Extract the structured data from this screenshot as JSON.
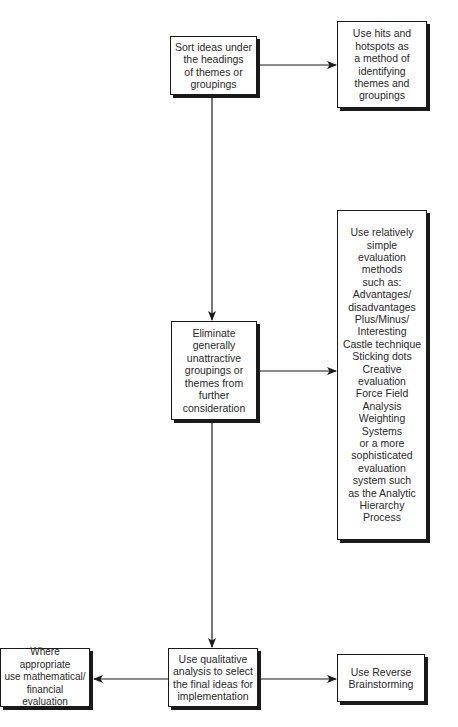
{
  "diagram": {
    "type": "flowchart",
    "nodes": {
      "sort": {
        "text": "Sort ideas under\nthe headings\nof themes or\ngroupings"
      },
      "hits": {
        "text": "Use hits and\nhotspots as\na method of\nidentifying\nthemes and\ngroupings"
      },
      "eliminate": {
        "text": "Eliminate\ngenerally\nunattractive\ngroupings or\nthemes from\nfurther\nconsideration"
      },
      "evaluation": {
        "text": "Use relatively\nsimple\nevaluation\nmethods\nsuch as:\nAdvantages/\ndisadvantages\nPlus/Minus/\nInteresting\nCastle technique\nSticking dots\nCreative\nevaluation\nForce Field\nAnalysis\nWeighting\nSystems\nor a more\nsophisticated\nevaluation\nsystem such\nas the Analytic\nHierarchy\nProcess"
      },
      "qualitative": {
        "text": "Use qualitative\nanalysis to select\nthe final ideas for\nimplementation"
      },
      "mathematical": {
        "text": "Where appropriate\nuse mathematical/\nfinancial\nevaluation"
      },
      "reverse": {
        "text": "Use Reverse\nBrainstorming"
      }
    },
    "edges": [
      {
        "from": "sort",
        "to": "hits"
      },
      {
        "from": "sort",
        "to": "eliminate"
      },
      {
        "from": "eliminate",
        "to": "evaluation"
      },
      {
        "from": "eliminate",
        "to": "qualitative"
      },
      {
        "from": "qualitative",
        "to": "mathematical"
      },
      {
        "from": "qualitative",
        "to": "reverse"
      }
    ]
  }
}
